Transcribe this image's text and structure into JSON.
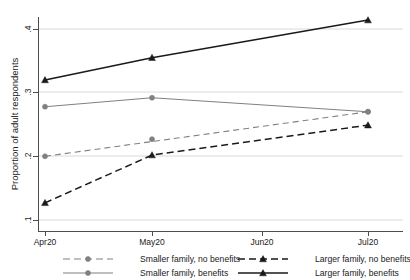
{
  "chart_data": {
    "type": "line",
    "title": "",
    "xlabel": "",
    "ylabel": "Proportion of adult respondents",
    "x": [
      "Apr20",
      "May20",
      "Jun20",
      "Jul20"
    ],
    "xtick_labels": [
      "Apr20",
      "May20",
      "Jun20",
      "Jul20"
    ],
    "ytick_labels": [
      ".1",
      ".2",
      ".3",
      ".4"
    ],
    "ytick_values": [
      0.1,
      0.2,
      0.3,
      0.4
    ],
    "ylim": [
      0.095,
      0.425
    ],
    "grid": "horizontal",
    "legend_position": "bottom",
    "series": [
      {
        "name": "Smaller family, no benefits",
        "color": "#808080",
        "style": "dashed",
        "marker": "circle",
        "x": [
          "Apr20",
          "Jul20"
        ],
        "values": [
          0.2,
          0.27
        ]
      },
      {
        "name": "Larger family, no benefits",
        "color": "#1a1a1a",
        "style": "dashed",
        "marker": "triangle",
        "x": [
          "Apr20",
          "May20",
          "Jul20"
        ],
        "values": [
          0.127,
          0.202,
          0.249
        ]
      },
      {
        "name": "Smaller family, benefits",
        "color": "#808080",
        "style": "solid",
        "marker": "circle",
        "x": [
          "Apr20",
          "May20",
          "Jul20"
        ],
        "values": [
          0.278,
          0.292,
          0.27
        ]
      },
      {
        "name": "Larger family, benefits",
        "color": "#1a1a1a",
        "style": "solid",
        "marker": "triangle",
        "x": [
          "Apr20",
          "May20",
          "Jul20"
        ],
        "values": [
          0.32,
          0.355,
          0.414
        ]
      }
    ],
    "series_midpoints": {
      "Smaller family, no benefits": {
        "May20": 0.227
      }
    },
    "legend": [
      {
        "label": "Smaller family, no benefits",
        "color": "#808080",
        "style": "dashed",
        "marker": "circle"
      },
      {
        "label": "Larger family, no benefits",
        "color": "#1a1a1a",
        "style": "dashed",
        "marker": "triangle"
      },
      {
        "label": "Smaller family, benefits",
        "color": "#808080",
        "style": "solid",
        "marker": "circle"
      },
      {
        "label": "Larger family, benefits",
        "color": "#1a1a1a",
        "style": "solid",
        "marker": "triangle"
      }
    ]
  }
}
